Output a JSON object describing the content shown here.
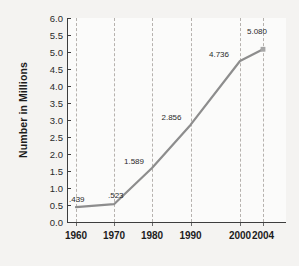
{
  "chart_data": {
    "type": "line",
    "title": "",
    "xlabel": "",
    "ylabel": "Number in Millions",
    "categories": [
      "1960",
      "1970",
      "1980",
      "1990",
      "2000",
      "2004"
    ],
    "x": [
      1960,
      1970,
      1980,
      1990,
      2000,
      2004
    ],
    "values": [
      0.439,
      0.523,
      1.589,
      2.856,
      4.736,
      5.08
    ],
    "point_labels": [
      ".439",
      ".523",
      "1.589",
      "2.856",
      "4.736",
      "5.080"
    ],
    "ylim": [
      0.0,
      6.0
    ],
    "ytick_labels": [
      "6.0",
      "5.5",
      "5.0",
      "4.5",
      "4.0",
      "3.5",
      "3.0",
      "2.5",
      "2.0",
      "1.5",
      "1.0",
      "0.5",
      "0.0"
    ],
    "ytick_values": [
      6.0,
      5.5,
      5.0,
      4.5,
      4.0,
      3.5,
      3.0,
      2.5,
      2.0,
      1.5,
      1.0,
      0.5,
      0.0
    ],
    "xtick_labels": [
      "1960",
      "1970",
      "1980",
      "1990",
      "2000",
      "2004"
    ],
    "grid": "vertical-dashed",
    "legend": "none",
    "series_color": "#8d8d8d",
    "grid_color": "#b6b2ae",
    "axis_color": "#3d3d3d",
    "plot_background": "#fbfbfa",
    "figure_background": "#f4f3f1"
  }
}
